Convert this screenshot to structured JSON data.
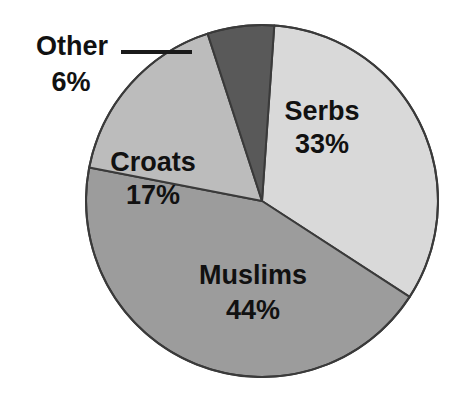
{
  "chart_data": {
    "type": "pie",
    "title": "",
    "subtitle": "",
    "xlabel": "",
    "ylabel": "",
    "legend_position": "none",
    "grid": false,
    "units": "%",
    "categories": [
      "Serbs",
      "Muslims",
      "Croats",
      "Other"
    ],
    "values": [
      33,
      44,
      17,
      6
    ],
    "labels_text": [
      "Serbs 33%",
      "Muslims 44%",
      "Croats 17%",
      "Other 6%"
    ],
    "slices": [
      {
        "name": "Serbs",
        "value": 33,
        "value_text": "33%",
        "color": "#d9d9d9",
        "label_placement": "inside",
        "label_x": 322,
        "label_y": 113,
        "pct_x": 322,
        "pct_y": 146,
        "start_angle_deg": 4,
        "end_angle_deg": 123
      },
      {
        "name": "Muslims",
        "value": 44,
        "value_text": "44%",
        "color": "#9c9c9c",
        "label_placement": "inside",
        "label_x": 253,
        "label_y": 277,
        "pct_x": 253,
        "pct_y": 312,
        "start_angle_deg": 123,
        "end_angle_deg": 281
      },
      {
        "name": "Croats",
        "value": 17,
        "value_text": "17%",
        "color": "#bcbcbc",
        "label_placement": "inside",
        "label_x": 153,
        "label_y": 164,
        "pct_x": 153,
        "pct_y": 197,
        "start_angle_deg": 281,
        "end_angle_deg": 342
      },
      {
        "name": "Other",
        "value": 6,
        "value_text": "6%",
        "color": "#595959",
        "label_placement": "callout",
        "label_x": 72,
        "label_y": 48,
        "pct_x": 71,
        "pct_y": 84,
        "start_angle_deg": 342,
        "end_angle_deg": 364,
        "leader_line": {
          "x1": 121,
          "y1": 52,
          "x2": 192,
          "y2": 52
        }
      }
    ],
    "geometry": {
      "center_x": 262,
      "center_y": 201,
      "radius": 176,
      "outline_color": "#3a3a3a",
      "outline_width": 2
    },
    "background_color": "#ffffff"
  }
}
